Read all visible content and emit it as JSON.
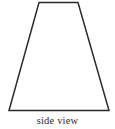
{
  "figure": {
    "caption": "side view",
    "shape_name": "trapezoid",
    "background_color": "#ffffff",
    "stroke_color": "#2b2b2b",
    "stroke_width": 1.5,
    "canvas": {
      "width": 115,
      "height": 129
    },
    "vertices": [
      {
        "label": "top-left",
        "x": 39,
        "y": 2.5
      },
      {
        "label": "top-right",
        "x": 78,
        "y": 2.5
      },
      {
        "label": "bottom-right",
        "x": 109,
        "y": 110.5
      },
      {
        "label": "bottom-left",
        "x": 9,
        "y": 110.5
      }
    ],
    "polygon_points": "39,2.5 78,2.5 109,110.5 9,110.5",
    "edges": [
      {
        "name": "top-edge",
        "from": "top-left",
        "to": "top-right"
      },
      {
        "name": "right-edge",
        "from": "top-right",
        "to": "bottom-right"
      },
      {
        "name": "bottom-edge",
        "from": "bottom-right",
        "to": "bottom-left"
      },
      {
        "name": "left-edge",
        "from": "bottom-left",
        "to": "top-left"
      }
    ]
  }
}
